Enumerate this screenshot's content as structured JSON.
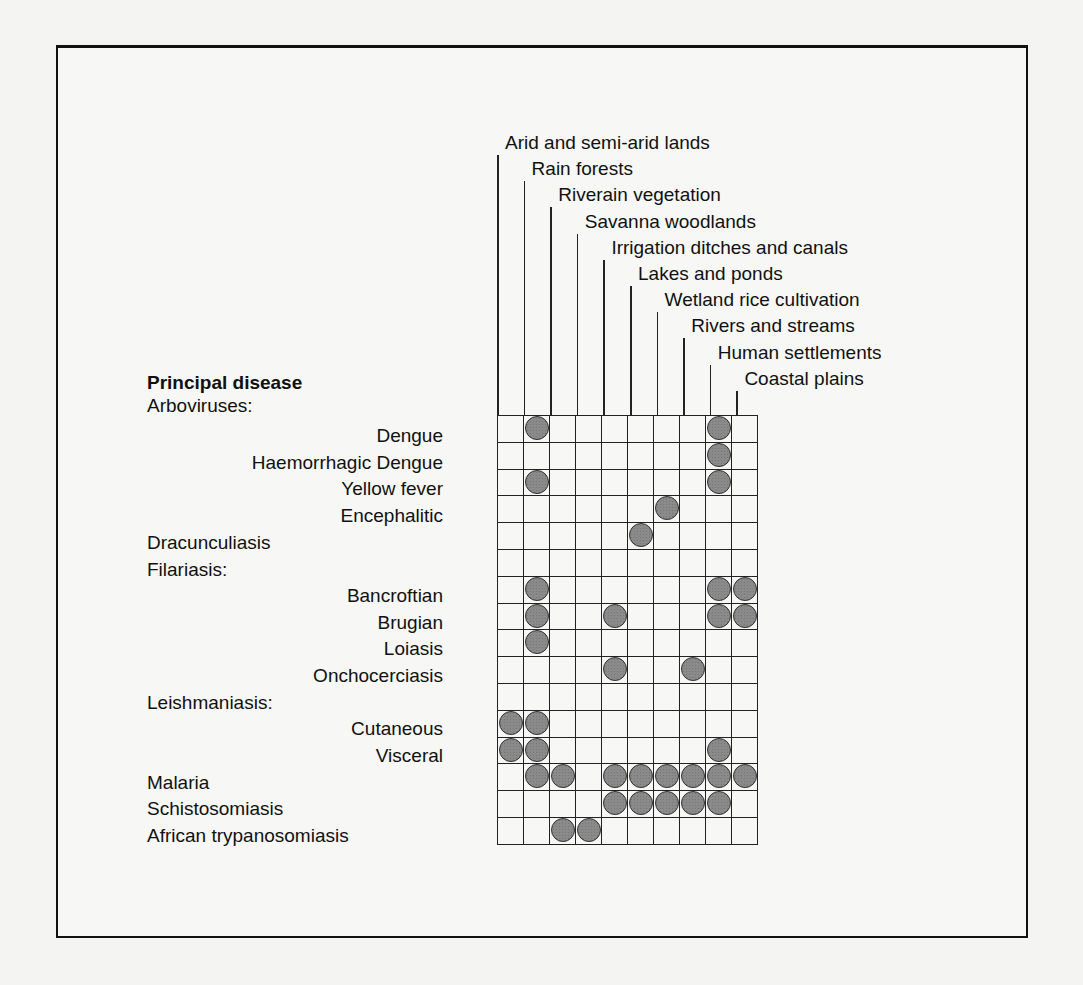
{
  "chart_data": {
    "type": "table",
    "columns": [
      "Arid and semi-arid lands",
      "Rain forests",
      "Riverain vegetation",
      "Savanna woodlands",
      "Irrigation ditches and canals",
      "Lakes and ponds",
      "Wetland rice cultivation",
      "Rivers and streams",
      "Human settlements",
      "Coastal plains"
    ],
    "row_header": "Principal disease",
    "rows": [
      {
        "label": "Dengue",
        "group": "Arboviruses:",
        "marks": [
          1,
          8
        ]
      },
      {
        "label": "Haemorrhagic Dengue",
        "group": "Arboviruses:",
        "marks": [
          8
        ]
      },
      {
        "label": "Yellow fever",
        "group": "Arboviruses:",
        "marks": [
          1,
          8
        ]
      },
      {
        "label": "Encephalitic",
        "group": "Arboviruses:",
        "marks": [
          6
        ]
      },
      {
        "label": "Dracunculiasis",
        "group": "",
        "marks": [
          5
        ]
      },
      {
        "label": "Filariasis:",
        "group": "header",
        "marks": []
      },
      {
        "label": "Bancroftian",
        "group": "Filariasis:",
        "marks": [
          1,
          8,
          9
        ]
      },
      {
        "label": "Brugian",
        "group": "Filariasis:",
        "marks": [
          1,
          4,
          8,
          9
        ]
      },
      {
        "label": "Loiasis",
        "group": "Filariasis:",
        "marks": [
          1
        ]
      },
      {
        "label": "Onchocerciasis",
        "group": "Filariasis:",
        "marks": [
          4,
          7
        ]
      },
      {
        "label": "Leishmaniasis:",
        "group": "header",
        "marks": []
      },
      {
        "label": "Cutaneous",
        "group": "Leishmaniasis:",
        "marks": [
          0,
          1
        ]
      },
      {
        "label": "Visceral",
        "group": "Leishmaniasis:",
        "marks": [
          0,
          1,
          8
        ]
      },
      {
        "label": "Malaria",
        "group": "",
        "marks": [
          1,
          2,
          4,
          5,
          6,
          7,
          8,
          9
        ]
      },
      {
        "label": "Schistosomiasis",
        "group": "",
        "marks": [
          4,
          5,
          6,
          7,
          8
        ]
      },
      {
        "label": "African trypanosomiasis",
        "group": "",
        "marks": [
          2,
          3
        ]
      }
    ]
  },
  "labels": {
    "principal": "Principal disease",
    "arboviruses": "Arboviruses:",
    "dengue": "Dengue",
    "haem": "Haemorrhagic Dengue",
    "yf": "Yellow fever",
    "enceph": "Encephalitic",
    "dracunc": "Dracunculiasis",
    "filariasis": "Filariasis:",
    "bancroftian": "Bancroftian",
    "brugian": "Brugian",
    "loiasis": "Loiasis",
    "oncho": "Onchocerciasis",
    "leish": "Leishmaniasis:",
    "cutaneous": "Cutaneous",
    "visceral": "Visceral",
    "malaria": "Malaria",
    "schisto": "Schistosomiasis",
    "tryp": "African trypanosomiasis"
  }
}
